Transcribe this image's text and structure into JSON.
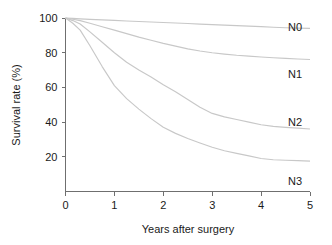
{
  "chart_data": {
    "type": "line",
    "title": "",
    "subtitle": "",
    "xlabel": "Years after surgery",
    "ylabel": "Survival rate (%)",
    "xlim": [
      0,
      5
    ],
    "ylim": [
      0,
      100
    ],
    "xticks": [
      "0",
      "1",
      "2",
      "3",
      "4",
      "5"
    ],
    "xtick_values": [
      0,
      1,
      2,
      3,
      4,
      5
    ],
    "yticks": [
      "20",
      "40",
      "60",
      "80",
      "100"
    ],
    "ytick_values": [
      20,
      40,
      60,
      80,
      100
    ],
    "grid": false,
    "legend_position": "right-inline-labels",
    "line_color": "#c8c8c8",
    "axis_color": "#6f6f6f",
    "text_color": "#1a1a1a",
    "background": "#ffffff",
    "series": [
      {
        "name": "N0",
        "label": "N0",
        "label_y_value": 95,
        "end_value": 94,
        "x": [
          0,
          0.15,
          0.3,
          0.5,
          0.75,
          1.0,
          1.25,
          1.5,
          1.75,
          2.0,
          2.25,
          2.5,
          2.75,
          3.0,
          3.25,
          3.5,
          3.75,
          4.0,
          4.25,
          4.5,
          4.75,
          5.0
        ],
        "values": [
          100,
          99.8,
          99.5,
          99.2,
          98.9,
          98.6,
          98.3,
          98.0,
          97.7,
          97.4,
          97.1,
          96.8,
          96.5,
          96.2,
          95.9,
          95.6,
          95.3,
          95.0,
          94.7,
          94.4,
          94.2,
          94.0
        ]
      },
      {
        "name": "N1",
        "label": "N1",
        "label_y_value": 68,
        "end_value": 76,
        "x": [
          0,
          0.15,
          0.3,
          0.5,
          0.75,
          1.0,
          1.25,
          1.5,
          1.75,
          2.0,
          2.25,
          2.5,
          2.75,
          3.0,
          3.25,
          3.5,
          3.75,
          4.0,
          4.25,
          4.5,
          4.75,
          5.0
        ],
        "values": [
          100,
          99.3,
          98.5,
          97.0,
          95.0,
          93.0,
          91.0,
          89.0,
          87.2,
          85.4,
          83.8,
          82.2,
          81.0,
          80.0,
          79.2,
          78.5,
          78.0,
          77.5,
          77.1,
          76.7,
          76.4,
          76.1
        ]
      },
      {
        "name": "N2",
        "label": "N2",
        "label_y_value": 40,
        "end_value": 36,
        "x": [
          0,
          0.15,
          0.3,
          0.5,
          0.75,
          1.0,
          1.25,
          1.5,
          1.75,
          2.0,
          2.25,
          2.5,
          2.75,
          3.0,
          3.25,
          3.5,
          3.75,
          4.0,
          4.25,
          4.5,
          4.75,
          5.0
        ],
        "values": [
          100,
          98.5,
          96.5,
          92.0,
          86.0,
          80.0,
          74.5,
          70.0,
          66.0,
          61.5,
          57.5,
          53.0,
          48.5,
          45.0,
          43.0,
          41.5,
          40.0,
          38.5,
          37.5,
          37.0,
          36.5,
          36.0
        ]
      },
      {
        "name": "N3",
        "label": "N3",
        "label_y_value": 6,
        "end_value": 17.5,
        "x": [
          0,
          0.15,
          0.3,
          0.5,
          0.75,
          1.0,
          1.25,
          1.5,
          1.75,
          2.0,
          2.25,
          2.5,
          2.75,
          3.0,
          3.25,
          3.5,
          3.75,
          4.0,
          4.25,
          4.5,
          4.75,
          5.0
        ],
        "values": [
          100,
          97.0,
          93.0,
          84.0,
          72.0,
          61.0,
          53.5,
          47.5,
          42.0,
          37.0,
          33.5,
          30.5,
          28.0,
          25.5,
          23.5,
          22.0,
          20.5,
          19.0,
          18.3,
          18.0,
          17.8,
          17.5
        ]
      }
    ]
  }
}
